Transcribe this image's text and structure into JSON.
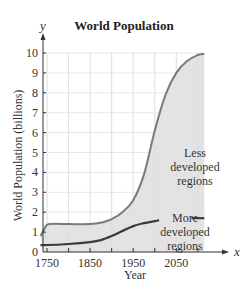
{
  "chart_data": {
    "type": "area",
    "title": "World Population",
    "xlabel": "Year",
    "ylabel": "World Population (billions)",
    "x_axis_symbol": "x",
    "y_axis_symbol": "y",
    "xlim": [
      1735,
      2115
    ],
    "ylim": [
      0,
      10
    ],
    "x_ticks": [
      1750,
      1800,
      1850,
      1900,
      1950,
      2000,
      2050,
      2100
    ],
    "x_tick_labels": [
      "1750",
      "1850",
      "1950",
      "2050"
    ],
    "y_ticks": [
      0,
      1,
      2,
      3,
      4,
      5,
      6,
      7,
      8,
      9,
      10
    ],
    "y_tick_labels": [
      "0",
      "1",
      "2",
      "3",
      "4",
      "5",
      "6",
      "7",
      "8",
      "9",
      "10"
    ],
    "grid": true,
    "legend": null,
    "series": [
      {
        "name": "Total (Less developed regions upper boundary)",
        "x": [
          1735,
          1745,
          1755,
          1800,
          1850,
          1880,
          1900,
          1925,
          1950,
          1975,
          2000,
          2025,
          2050,
          2075,
          2100,
          2115
        ],
        "values": [
          0.8,
          1.2,
          1.4,
          1.4,
          1.4,
          1.5,
          1.65,
          2.0,
          2.6,
          3.9,
          6.1,
          7.9,
          9.0,
          9.6,
          9.9,
          9.95
        ]
      },
      {
        "name": "More developed regions",
        "x": [
          1735,
          1750,
          1800,
          1850,
          1875,
          1900,
          1925,
          1950,
          1975,
          2000,
          2010
        ],
        "values": [
          0.35,
          0.35,
          0.4,
          0.5,
          0.6,
          0.8,
          1.05,
          1.3,
          1.45,
          1.55,
          1.6
        ],
        "extra_segment": {
          "x": [
            2085,
            2115
          ],
          "values": [
            1.7,
            1.7
          ]
        }
      }
    ],
    "annotations": [
      {
        "text": "Less developed regions",
        "x": 2070,
        "y": 4.0
      },
      {
        "text": "More developed regions",
        "x": 2070,
        "y": 1.0
      }
    ]
  },
  "labels": {
    "title": "World Population",
    "xlabel": "Year",
    "ylabel": "World Population (billions)",
    "less_1": "Less",
    "less_2": "developed",
    "less_3": "regions",
    "more_1": "More",
    "more_2": "developed",
    "more_3": "regions",
    "x_sym": "x",
    "y_sym": "y"
  },
  "colors": {
    "fill": "#e3e3e3",
    "upper_curve": "#7a7a7a",
    "lower_curve": "#3a3a3a",
    "grid": "#e8e8e8",
    "axis": "#333333"
  }
}
